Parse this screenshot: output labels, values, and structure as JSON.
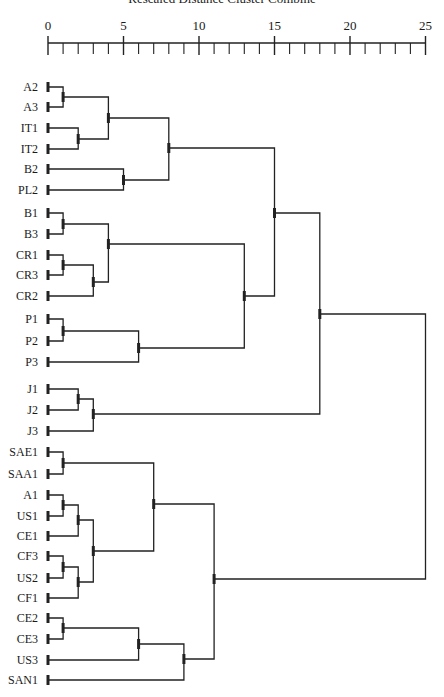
{
  "chart_data": {
    "type": "dendrogram",
    "title": "Rescaled Distance Cluster Combine",
    "xlabel": "Rescaled Distance Cluster Combine",
    "ylabel": "",
    "xlim": [
      0,
      25
    ],
    "x_ticks": [
      0,
      5,
      10,
      15,
      20,
      25
    ],
    "minor_tick_step": 1,
    "grid": false,
    "legend": null,
    "leaves": [
      {
        "label": "A2",
        "y": 87
      },
      {
        "label": "A3",
        "y": 107
      },
      {
        "label": "IT1",
        "y": 128
      },
      {
        "label": "IT2",
        "y": 149
      },
      {
        "label": "B2",
        "y": 169
      },
      {
        "label": "PL2",
        "y": 190
      },
      {
        "label": "B1",
        "y": 213
      },
      {
        "label": "B3",
        "y": 234
      },
      {
        "label": "CR1",
        "y": 255
      },
      {
        "label": "CR3",
        "y": 275
      },
      {
        "label": "CR2",
        "y": 296
      },
      {
        "label": "P1",
        "y": 319
      },
      {
        "label": "P2",
        "y": 341
      },
      {
        "label": "P3",
        "y": 362
      },
      {
        "label": "J1",
        "y": 389
      },
      {
        "label": "J2",
        "y": 410
      },
      {
        "label": "J3",
        "y": 431
      },
      {
        "label": "SAE1",
        "y": 452
      },
      {
        "label": "SAA1",
        "y": 474
      },
      {
        "label": "A1",
        "y": 495
      },
      {
        "label": "US1",
        "y": 516
      },
      {
        "label": "CE1",
        "y": 536
      },
      {
        "label": "CF3",
        "y": 556
      },
      {
        "label": "US2",
        "y": 578
      },
      {
        "label": "CF1",
        "y": 598
      },
      {
        "label": "CE2",
        "y": 618
      },
      {
        "label": "CE3",
        "y": 639
      },
      {
        "label": "US3",
        "y": 660
      },
      {
        "label": "SAN1",
        "y": 680
      }
    ],
    "merges": [
      {
        "id": "n1",
        "children": [
          "A2",
          "A3"
        ],
        "distance": 1,
        "y": 97
      },
      {
        "id": "n2",
        "children": [
          "IT1",
          "IT2"
        ],
        "distance": 2,
        "y": 139
      },
      {
        "id": "n3",
        "children": [
          "n1",
          "n2"
        ],
        "distance": 4,
        "y": 118
      },
      {
        "id": "n4",
        "children": [
          "B2",
          "PL2"
        ],
        "distance": 5,
        "y": 180
      },
      {
        "id": "n5",
        "children": [
          "n3",
          "n4"
        ],
        "distance": 8,
        "y": 148
      },
      {
        "id": "n6",
        "children": [
          "B1",
          "B3"
        ],
        "distance": 1,
        "y": 224
      },
      {
        "id": "n7",
        "children": [
          "CR1",
          "CR3"
        ],
        "distance": 1,
        "y": 265
      },
      {
        "id": "n8",
        "children": [
          "n7",
          "CR2"
        ],
        "distance": 3,
        "y": 282
      },
      {
        "id": "n9",
        "children": [
          "n6",
          "n8"
        ],
        "distance": 4,
        "y": 244
      },
      {
        "id": "n10",
        "children": [
          "P1",
          "P2"
        ],
        "distance": 1,
        "y": 331
      },
      {
        "id": "n11",
        "children": [
          "n10",
          "P3"
        ],
        "distance": 6,
        "y": 348
      },
      {
        "id": "n12",
        "children": [
          "n9",
          "n11"
        ],
        "distance": 13,
        "y": 296
      },
      {
        "id": "n13",
        "children": [
          "n5",
          "n12"
        ],
        "distance": 15,
        "y": 213
      },
      {
        "id": "n14",
        "children": [
          "J1",
          "J2"
        ],
        "distance": 2,
        "y": 399
      },
      {
        "id": "n15",
        "children": [
          "n14",
          "J3"
        ],
        "distance": 3,
        "y": 414
      },
      {
        "id": "n16",
        "children": [
          "n13",
          "n15"
        ],
        "distance": 18,
        "y": 314
      },
      {
        "id": "n17",
        "children": [
          "SAE1",
          "SAA1"
        ],
        "distance": 1,
        "y": 463
      },
      {
        "id": "n18",
        "children": [
          "A1",
          "US1"
        ],
        "distance": 1,
        "y": 505
      },
      {
        "id": "n19",
        "children": [
          "n18",
          "CE1"
        ],
        "distance": 2,
        "y": 520
      },
      {
        "id": "n20",
        "children": [
          "CF3",
          "US2"
        ],
        "distance": 1,
        "y": 567
      },
      {
        "id": "n21",
        "children": [
          "n20",
          "CF1"
        ],
        "distance": 2,
        "y": 582
      },
      {
        "id": "n22",
        "children": [
          "n19",
          "n21"
        ],
        "distance": 3,
        "y": 551
      },
      {
        "id": "n23",
        "children": [
          "n17",
          "n22"
        ],
        "distance": 7,
        "y": 504
      },
      {
        "id": "n24",
        "children": [
          "CE2",
          "CE3"
        ],
        "distance": 1,
        "y": 628
      },
      {
        "id": "n25",
        "children": [
          "n24",
          "US3"
        ],
        "distance": 6,
        "y": 644
      },
      {
        "id": "n26",
        "children": [
          "n25",
          "SAN1"
        ],
        "distance": 9,
        "y": 659
      },
      {
        "id": "n27",
        "children": [
          "n23",
          "n26"
        ],
        "distance": 11,
        "y": 579
      },
      {
        "id": "n28",
        "children": [
          "n16",
          "n27"
        ],
        "distance": 25,
        "y": 447,
        "root": true
      }
    ]
  },
  "layout": {
    "x0_px": 48,
    "px_per_unit": 15.1,
    "axis_y": 43,
    "label_right_x": 38,
    "line_color": "#222222"
  }
}
